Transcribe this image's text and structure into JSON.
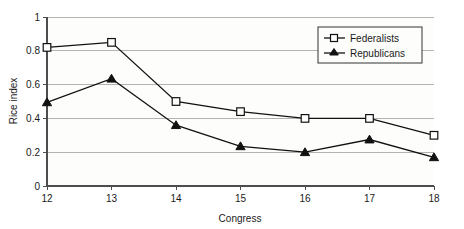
{
  "chart_data": {
    "type": "line",
    "title": "",
    "xlabel": "Congress",
    "ylabel": "Rice index",
    "x": [
      12,
      13,
      14,
      15,
      16,
      17,
      18
    ],
    "categories": [
      "12",
      "13",
      "14",
      "15",
      "16",
      "17",
      "18"
    ],
    "xlim": [
      12,
      18
    ],
    "ylim": [
      0,
      1
    ],
    "yticks": [
      "0",
      "0.2",
      "0.4",
      "0.6",
      "0.8",
      "1"
    ],
    "ytick_values": [
      0,
      0.2,
      0.4,
      0.6,
      0.8,
      1
    ],
    "grid": "horizontal",
    "legend_position": "top-right",
    "series": [
      {
        "name": "Federalists",
        "marker": "open-square",
        "values": [
          0.82,
          0.85,
          0.5,
          0.44,
          0.4,
          0.4,
          0.3
        ]
      },
      {
        "name": "Republicans",
        "marker": "filled-triangle",
        "values": [
          0.495,
          0.635,
          0.36,
          0.235,
          0.2,
          0.275,
          0.17
        ]
      }
    ]
  },
  "colors": {
    "line": "#111111",
    "grid": "#b3b3b3",
    "axis": "#4d4d4d",
    "plot_background": "#fdfdfb",
    "page_background": "#ffffff"
  },
  "legend": {
    "entries": [
      {
        "label": "Federalists"
      },
      {
        "label": "Republicans"
      }
    ]
  },
  "axes": {
    "x_title": "Congress",
    "y_title": "Rice index",
    "x_tick_labels": [
      "12",
      "13",
      "14",
      "15",
      "16",
      "17",
      "18"
    ],
    "y_tick_labels": [
      "0",
      "0.2",
      "0.4",
      "0.6",
      "0.8",
      "1"
    ]
  }
}
